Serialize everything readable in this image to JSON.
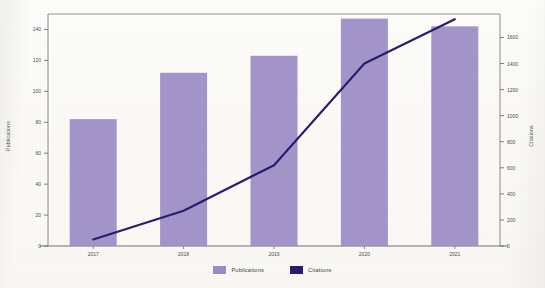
{
  "chart_data": {
    "type": "bar",
    "title": "",
    "subtitle": "",
    "xlabel": "",
    "ylabel": "Publications",
    "y2label": "Citations",
    "categories": [
      "2017",
      "2018",
      "2019",
      "2020",
      "2021"
    ],
    "grid": false,
    "legend_position": "bottom",
    "ylim": [
      0,
      150
    ],
    "y2lim": [
      0,
      1780
    ],
    "yticks": [
      0,
      20,
      40,
      60,
      80,
      100,
      120,
      140
    ],
    "y2ticks": [
      0,
      200,
      400,
      600,
      800,
      1000,
      1200,
      1400,
      1600
    ],
    "ytick_labels": [
      "0",
      "20",
      "40",
      "60",
      "80",
      "100",
      "120",
      "140"
    ],
    "y2tick_labels": [
      "0",
      "200",
      "400",
      "600",
      "800",
      "1000",
      "1200",
      "1400",
      "1600"
    ],
    "series": [
      {
        "name": "Publications",
        "chart_type": "bar",
        "axis": "left",
        "color": "#9b8bc4",
        "values": [
          82,
          112,
          123,
          147,
          142
        ]
      },
      {
        "name": "Citations",
        "chart_type": "line",
        "axis": "right",
        "color": "#2a1a6e",
        "values": [
          50,
          270,
          620,
          1400,
          1740
        ]
      }
    ]
  },
  "legend": {
    "items": [
      {
        "label": "Publications",
        "color": "#9b8bc4"
      },
      {
        "label": "Citations",
        "color": "#2a1a6e"
      }
    ]
  },
  "axes": {
    "left_title": "Publications",
    "right_title": "Citations"
  }
}
